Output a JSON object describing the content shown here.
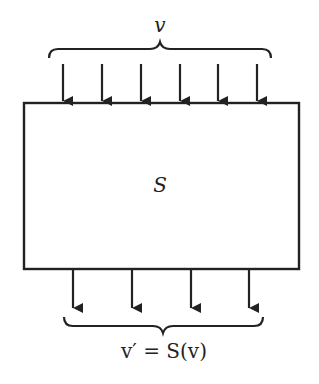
{
  "diagram": {
    "top_label": "v",
    "box_label": "S",
    "bottom_label": "v′ = S(v)",
    "input_arrow_count": 6,
    "output_arrow_count": 4,
    "colors": {
      "stroke": "#222222",
      "background": "#ffffff"
    }
  }
}
